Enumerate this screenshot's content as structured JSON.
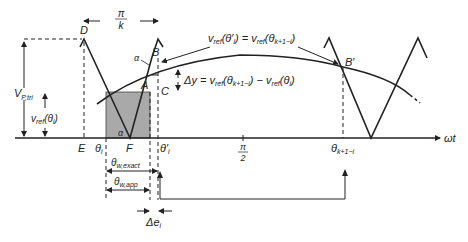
{
  "diagram": {
    "axis_label": "ωt",
    "top_span": {
      "num": "π",
      "den": "k"
    },
    "points": {
      "D": "D",
      "E": "E",
      "F": "F",
      "A": "A",
      "B": "B",
      "C": "C",
      "B_prime": "B′",
      "alpha_top": "α",
      "alpha_bottom": "α"
    },
    "left_labels": {
      "v_p_tri": {
        "main": "V",
        "sub": "P,tri"
      },
      "v_ref_theta_i": {
        "main": "v",
        "sub": "ref",
        "arg": "(θ",
        "argsub": "i",
        "close": ")"
      }
    },
    "x_ticks": {
      "theta_i": {
        "main": "θ",
        "sub": "i"
      },
      "theta_i_prime": {
        "main": "θ′",
        "sub": "i"
      },
      "pi_over_2": {
        "num": "π",
        "den": "2"
      },
      "theta_k1i": {
        "main": "θ",
        "sub": "k+1−i"
      }
    },
    "equations": {
      "symmetry": {
        "lhs": "v",
        "lhs_sub": "ref",
        "lhs_arg": "(θ′",
        "lhs_argsub": "i",
        "eq": ") = v",
        "rhs_sub": "ref",
        "rhs_arg": "(θ",
        "rhs_argsub": "k+1−i",
        "close": ")"
      },
      "delta_y": {
        "lhs": "Δy = v",
        "sub1": "ref",
        "arg1": "(θ",
        "argsub1": "k+1−i",
        "mid": ") − v",
        "sub2": "ref",
        "arg2": "(θ",
        "argsub2": "i",
        "close": ")"
      }
    },
    "widths": {
      "exact": {
        "main": "θ",
        "sub": "w,exact"
      },
      "app": {
        "main": "θ",
        "sub": "w,app"
      },
      "delta_e": {
        "main": "Δe",
        "sub": "i"
      }
    },
    "colors": {
      "line": "#222222",
      "shade": "#a9a9a9",
      "background": "#ffffff"
    }
  }
}
